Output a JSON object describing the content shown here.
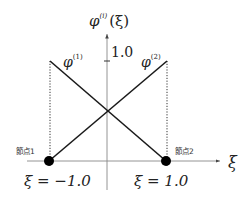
{
  "diagram": {
    "y_axis_label": {
      "base": "φ",
      "superscript": "(i)",
      "arg": "(ξ)"
    },
    "x_axis_label": "ξ",
    "y_tick_label": "1.0",
    "curves": [
      {
        "name": "φ",
        "superscript": "(1)",
        "from": [
          -1.0,
          1.0
        ],
        "to": [
          1.0,
          0.0
        ]
      },
      {
        "name": "φ",
        "superscript": "(2)",
        "from": [
          -1.0,
          0.0
        ],
        "to": [
          1.0,
          1.0
        ]
      }
    ],
    "nodes": [
      {
        "label": "節点1",
        "xi_label": "ξ = −1.0"
      },
      {
        "label": "節点2",
        "xi_label": "ξ = 1.0"
      }
    ],
    "colors": {
      "line": "#1a1a1a",
      "axis": "#888888",
      "node": "#000000"
    }
  }
}
